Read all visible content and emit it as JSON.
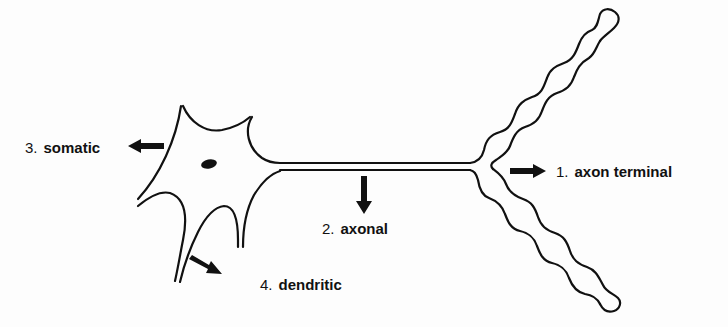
{
  "diagram": {
    "labels": [
      {
        "id": "axon-terminal",
        "number": "1.",
        "text": "axon terminal",
        "arrow_direction": "right"
      },
      {
        "id": "axonal",
        "number": "2.",
        "text": "axonal",
        "arrow_direction": "down"
      },
      {
        "id": "somatic",
        "number": "3.",
        "text": "somatic",
        "arrow_direction": "left"
      },
      {
        "id": "dendritic",
        "number": "4.",
        "text": "dendritic",
        "arrow_direction": "down-right"
      }
    ],
    "structures": [
      {
        "name": "soma",
        "has_nucleus": true
      },
      {
        "name": "axon"
      },
      {
        "name": "axon-terminal-branches",
        "count": 2
      },
      {
        "name": "dendrites",
        "count": 4
      }
    ],
    "colors": {
      "ink": "#111111",
      "background": "#fdfdfd"
    }
  }
}
